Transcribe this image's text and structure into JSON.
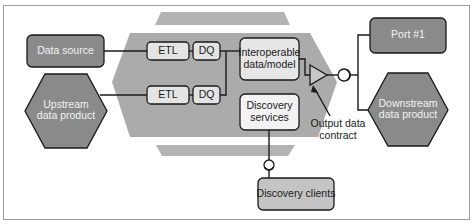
{
  "diagram": {
    "type": "data-product-architecture",
    "colors": {
      "frame": "#9a9a9a",
      "dark_box": "#8a8a8a",
      "light_box": "#e6e6e6",
      "mid_box": "#c2c2c2",
      "container_hex": "#ababab",
      "band": "#b0b0b0",
      "line": "#1a1a1a"
    },
    "inputs": {
      "data_source": "Data source",
      "upstream_line1": "Upstream",
      "upstream_line2": "data product"
    },
    "pipeline": {
      "row1": {
        "etl": "ETL",
        "dq": "DQ"
      },
      "row2": {
        "etl": "ETL",
        "dq": "DQ"
      }
    },
    "core": {
      "interop_line1": "Interoperable",
      "interop_line2": "data/model",
      "discovery_line1": "Discovery",
      "discovery_line2": "services"
    },
    "contract": {
      "label_line1": "Output data",
      "label_line2": "contract"
    },
    "outputs": {
      "port": "Port #1",
      "downstream_line1": "Downstream",
      "downstream_line2": "data product"
    },
    "clients": {
      "label": "Discovery clients"
    }
  }
}
